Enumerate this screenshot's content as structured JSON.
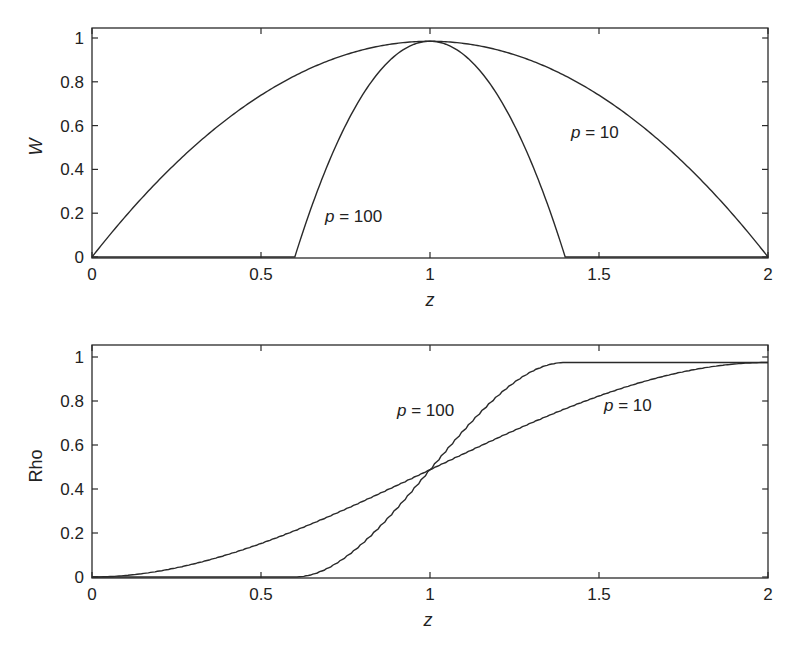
{
  "chart_data": [
    {
      "type": "line",
      "title": "",
      "xlabel": "z",
      "ylabel": "W",
      "xlim": [
        0,
        2
      ],
      "ylim": [
        0,
        1.05
      ],
      "xticks": [
        "0",
        "0.5",
        "1",
        "1.5",
        "2"
      ],
      "yticks": [
        "0",
        "0.2",
        "0.4",
        "0.6",
        "0.8",
        "1"
      ],
      "grid": false,
      "legend": "none (inline annotations)",
      "x": [
        0,
        0.1,
        0.2,
        0.3,
        0.4,
        0.5,
        0.6,
        0.7,
        0.8,
        0.9,
        1.0,
        1.1,
        1.2,
        1.3,
        1.4,
        1.5,
        1.6,
        1.7,
        1.8,
        1.9,
        2.0
      ],
      "series": [
        {
          "name": "p = 10",
          "values": [
            0,
            0.19,
            0.36,
            0.51,
            0.64,
            0.75,
            0.84,
            0.91,
            0.96,
            0.99,
            1.0,
            0.99,
            0.96,
            0.91,
            0.84,
            0.75,
            0.64,
            0.51,
            0.36,
            0.19,
            0
          ]
        },
        {
          "name": "p = 100",
          "values": [
            0,
            0,
            0,
            0,
            0,
            0,
            0,
            0.44,
            0.75,
            0.94,
            1.0,
            0.94,
            0.75,
            0.44,
            0,
            0,
            0,
            0,
            0,
            0,
            0
          ]
        }
      ],
      "annotations": [
        {
          "text": "p = 100",
          "x": 0.78,
          "y": 0.2
        },
        {
          "text": "p = 10",
          "x": 1.64,
          "y": 0.58
        }
      ]
    },
    {
      "type": "line",
      "title": "",
      "xlabel": "z",
      "ylabel": "Rho",
      "xlim": [
        0,
        2
      ],
      "ylim": [
        0,
        1.05
      ],
      "xticks": [
        "0",
        "0.5",
        "1",
        "1.5",
        "2"
      ],
      "yticks": [
        "0",
        "0.2",
        "0.4",
        "0.6",
        "0.8",
        "1"
      ],
      "grid": false,
      "legend": "none (inline annotations)",
      "x": [
        0,
        0.1,
        0.2,
        0.3,
        0.4,
        0.5,
        0.6,
        0.7,
        0.8,
        0.9,
        1.0,
        1.1,
        1.2,
        1.3,
        1.4,
        1.5,
        1.6,
        1.7,
        1.8,
        1.9,
        2.0
      ],
      "series": [
        {
          "name": "p = 10",
          "values": [
            0,
            0.01,
            0.03,
            0.07,
            0.1,
            0.16,
            0.22,
            0.28,
            0.35,
            0.42,
            0.49,
            0.57,
            0.63,
            0.7,
            0.76,
            0.82,
            0.87,
            0.91,
            0.94,
            0.97,
            0.98
          ]
        },
        {
          "name": "p = 100",
          "values": [
            0,
            0,
            0,
            0,
            0,
            0,
            0,
            0.04,
            0.16,
            0.32,
            0.49,
            0.67,
            0.83,
            0.94,
            0.98,
            0.98,
            0.98,
            0.98,
            0.98,
            0.98,
            0.98
          ]
        }
      ],
      "annotations": [
        {
          "text": "p = 100",
          "x": 0.94,
          "y": 0.75
        },
        {
          "text": "p = 10",
          "x": 1.53,
          "y": 0.77
        }
      ]
    }
  ],
  "plots": {
    "top": {
      "ylabel": "W",
      "xlabel": "z",
      "xticks": [
        "0",
        "0.5",
        "1",
        "1.5",
        "2"
      ],
      "yticks": [
        "0",
        "0.2",
        "0.4",
        "0.6",
        "0.8",
        "1"
      ],
      "annot_p100_var": "p",
      "annot_p100_rest": " = 100",
      "annot_p10_var": "p",
      "annot_p10_rest": " = 10"
    },
    "bottom": {
      "ylabel": "Rho",
      "xlabel": "z",
      "xticks": [
        "0",
        "0.5",
        "1",
        "1.5",
        "2"
      ],
      "yticks": [
        "0",
        "0.2",
        "0.4",
        "0.6",
        "0.8",
        "1"
      ],
      "annot_p100_var": "p",
      "annot_p100_rest": " = 100",
      "annot_p10_var": "p",
      "annot_p10_rest": " = 10"
    }
  },
  "colors": {
    "line": "#2a2a2a",
    "axes": "#2a2a2a",
    "background": "#ffffff"
  }
}
